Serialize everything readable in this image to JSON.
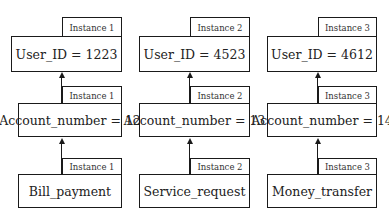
{
  "diagram": {
    "columns": [
      {
        "instance_label": "Instance 1",
        "top": {
          "label": "User_ID = 1223",
          "tab": "Instance 1"
        },
        "middle": {
          "label": "Account_number = 12",
          "tab": "Instance 1"
        },
        "bottom": {
          "label": "Bill_payment",
          "tab": "Instance 1"
        }
      },
      {
        "instance_label": "Instance 2",
        "top": {
          "label": "User_ID = 4523",
          "tab": "Instance 2"
        },
        "middle": {
          "label": "Account_number = 13",
          "tab": "Instance 2"
        },
        "bottom": {
          "label": "Service_request",
          "tab": "Instance 2"
        }
      },
      {
        "instance_label": "Instance 3",
        "top": {
          "label": "User_ID = 4612",
          "tab": "Instance 3"
        },
        "middle": {
          "label": "Account_number = 14",
          "tab": "Instance 3"
        },
        "bottom": {
          "label": "Money_transfer",
          "tab": "Instance 3"
        }
      }
    ],
    "edges": [
      {
        "from": "Bill_payment",
        "to": "Account_number = 12"
      },
      {
        "from": "Account_number = 12",
        "to": "User_ID = 1223"
      },
      {
        "from": "Service_request",
        "to": "Account_number = 13"
      },
      {
        "from": "Account_number = 13",
        "to": "User_ID = 4523"
      },
      {
        "from": "Money_transfer",
        "to": "Account_number = 14"
      },
      {
        "from": "Account_number = 14",
        "to": "User_ID = 4612"
      }
    ]
  }
}
